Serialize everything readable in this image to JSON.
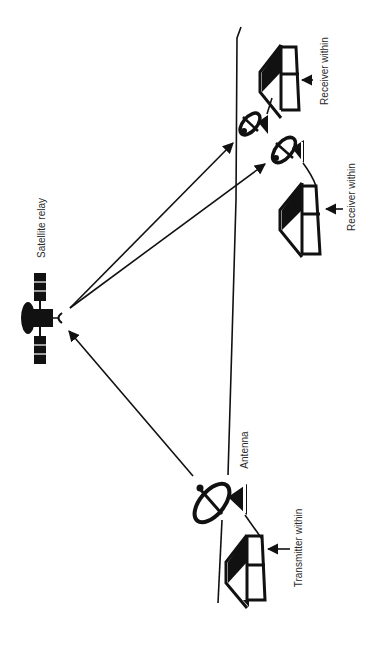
{
  "diagram": {
    "orientation": "rotated -90deg",
    "colors": {
      "ink": "#111111",
      "text": "#2a2a2a",
      "background": "#ffffff"
    },
    "labels": {
      "satellite": "Satellite relay",
      "antenna": "Antenna",
      "transmitter": "Transmitter within",
      "receiver_1": "Receiver within",
      "receiver_2": "Receiver within"
    },
    "nodes": [
      {
        "id": "satellite",
        "type": "satellite-icon",
        "label": "Satellite relay"
      },
      {
        "id": "tx-antenna",
        "type": "dish-antenna-icon",
        "label": "Antenna"
      },
      {
        "id": "tx-house",
        "type": "house-icon",
        "label": "Transmitter within"
      },
      {
        "id": "rx-antenna-1",
        "type": "dish-antenna-icon"
      },
      {
        "id": "rx-house-1",
        "type": "house-icon",
        "label": "Receiver within"
      },
      {
        "id": "rx-antenna-2",
        "type": "dish-antenna-icon"
      },
      {
        "id": "rx-house-2",
        "type": "house-icon",
        "label": "Receiver within"
      }
    ],
    "edges": [
      {
        "from": "tx-antenna",
        "to": "satellite",
        "style": "arrow"
      },
      {
        "from": "satellite",
        "to": "rx-antenna-1",
        "style": "arrow"
      },
      {
        "from": "satellite",
        "to": "rx-antenna-2",
        "style": "arrow"
      }
    ]
  }
}
